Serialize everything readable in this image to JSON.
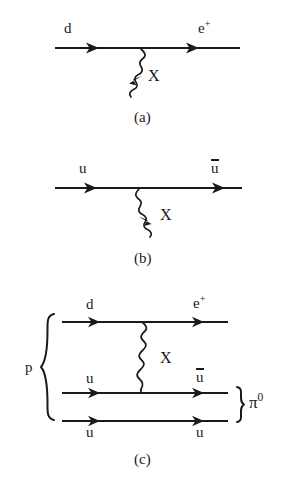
{
  "figure": {
    "ink_color": "#1a1a1a",
    "background_color": "#ffffff"
  },
  "diagrams": [
    {
      "id": "diagram-a",
      "caption": "(a)",
      "incoming_label": "d",
      "outgoing_label": "e",
      "outgoing_superscript": "+",
      "boson_label": "X",
      "boson_type": "wavy",
      "fermion_lines": 1
    },
    {
      "id": "diagram-b",
      "caption": "(b)",
      "incoming_label": "u",
      "outgoing_label": "u",
      "outgoing_has_overbar": true,
      "boson_label": "X",
      "boson_type": "wavy",
      "fermion_lines": 1
    },
    {
      "id": "diagram-c",
      "caption": "(c)",
      "boson_label": "X",
      "boson_type": "wavy",
      "left_brace_label": "p",
      "right_brace_label": "π",
      "right_brace_superscript": "0",
      "lines": [
        {
          "in_label": "d",
          "out_label": "e",
          "out_superscript": "+",
          "out_overbar": false
        },
        {
          "in_label": "u",
          "out_label": "u",
          "out_superscript": "",
          "out_overbar": true
        },
        {
          "in_label": "u",
          "out_label": "u",
          "out_superscript": "",
          "out_overbar": false
        }
      ]
    }
  ]
}
